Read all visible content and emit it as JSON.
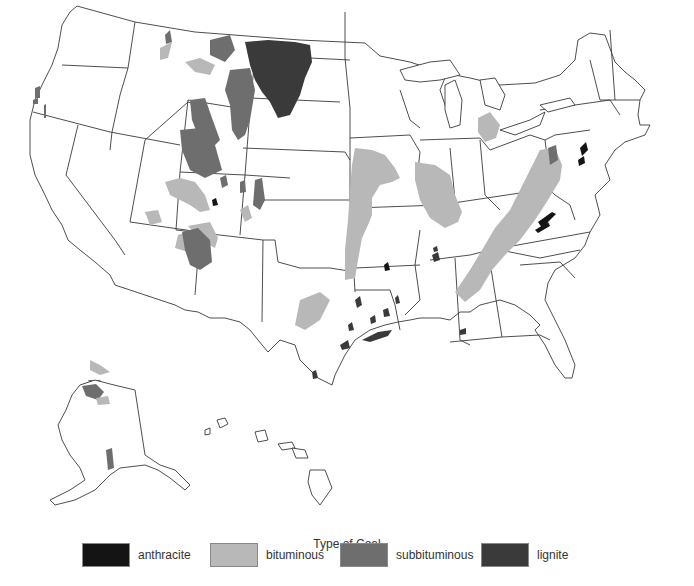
{
  "map": {
    "subject": "Coal deposits of the United States",
    "regions_shown": [
      "Contiguous United States",
      "Alaska",
      "Hawaii"
    ]
  },
  "legend": {
    "title": "Type of Coal",
    "items": [
      {
        "label": "anthracite",
        "color": "#141414"
      },
      {
        "label": "bituminous",
        "color": "#b8b8b8"
      },
      {
        "label": "subbituminous",
        "color": "#6e6e6e"
      },
      {
        "label": "lignite",
        "color": "#3a3a3a"
      }
    ]
  },
  "colors": {
    "anthracite": "#141414",
    "bituminous": "#b8b8b8",
    "subbituminous": "#6e6e6e",
    "lignite": "#3a3a3a",
    "border": "#3a3a3a",
    "background": "#ffffff"
  }
}
